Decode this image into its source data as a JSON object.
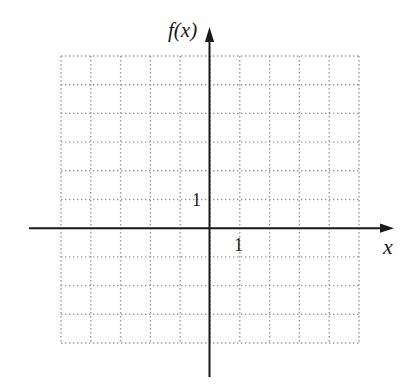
{
  "chart_data": {
    "type": "line",
    "title": "",
    "xlabel": "x",
    "ylabel": "f(x)",
    "x_tick_label": "1",
    "y_tick_label": "1",
    "xlim": [
      -5,
      5
    ],
    "ylim": [
      -4,
      6
    ],
    "grid": true,
    "grid_style": "dotted",
    "grid_cells": {
      "columns": 10,
      "rows": 10
    },
    "series": [],
    "legend": null
  },
  "labels": {
    "y_axis": "f(x)",
    "x_axis": "x",
    "x_unit": "1",
    "y_unit": "1"
  },
  "colors": {
    "axis": "#1a1a1a",
    "grid": "#9a9a9a",
    "background": "#ffffff"
  }
}
